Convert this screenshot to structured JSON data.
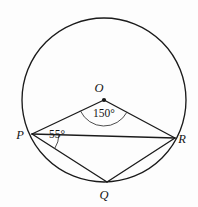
{
  "figure": {
    "kind": "circle-geometry-diagram",
    "background_color": "#fdfdfd",
    "line_color": "#1b1b1b",
    "arc_marker_color": "#3a3a3a"
  },
  "circle": {
    "name": "main-circle",
    "center_label": "O",
    "center_x": 104,
    "center_y": 100,
    "radius": 82
  },
  "points": [
    {
      "id": "O",
      "label": "O",
      "x": 104,
      "y": 100,
      "label_x": 99,
      "label_y": 92,
      "on_circle": false,
      "is_center": true
    },
    {
      "id": "P",
      "label": "P",
      "x": 32,
      "y": 134,
      "label_x": 20,
      "label_y": 139,
      "on_circle": true,
      "is_center": false
    },
    {
      "id": "Q",
      "label": "Q",
      "x": 107,
      "y": 182,
      "label_x": 104,
      "label_y": 199,
      "on_circle": true,
      "is_center": false
    },
    {
      "id": "R",
      "label": "R",
      "x": 175,
      "y": 138,
      "label_x": 182,
      "label_y": 143,
      "on_circle": true,
      "is_center": false
    }
  ],
  "segments": [
    {
      "id": "OP",
      "from": "O",
      "to": "P",
      "name": "radius-op"
    },
    {
      "id": "OR",
      "from": "O",
      "to": "R",
      "name": "radius-or"
    },
    {
      "id": "PQ",
      "from": "P",
      "to": "Q",
      "name": "chord-pq"
    },
    {
      "id": "QR",
      "from": "Q",
      "to": "R",
      "name": "chord-qr"
    },
    {
      "id": "PR",
      "from": "P",
      "to": "R",
      "name": "chord-pr"
    }
  ],
  "angles": [
    {
      "id": "POR",
      "vertex": "O",
      "value": 150,
      "label": "150°",
      "label_x": 104,
      "label_y": 117,
      "marker_radius": 26,
      "type": "central-angle"
    },
    {
      "id": "QPR",
      "vertex": "P",
      "value": 55,
      "label": "55°",
      "label_x": 57,
      "label_y": 138,
      "marker_radius": 27,
      "type": "inscribed-angle"
    }
  ],
  "labels": {
    "center": "O",
    "left_vertex": "P",
    "bottom_vertex": "Q",
    "right_vertex": "R",
    "central_angle": "150°",
    "inscribed_angle": "55°"
  }
}
